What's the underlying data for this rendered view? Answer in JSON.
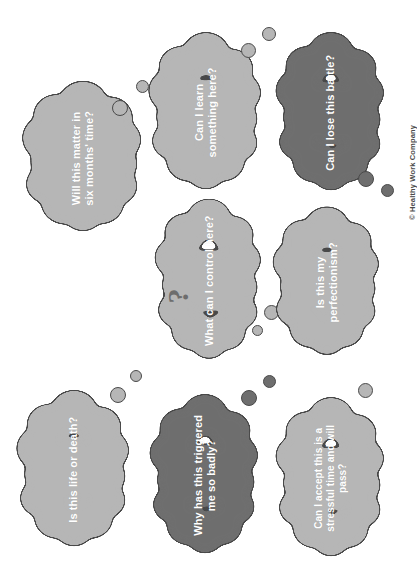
{
  "poster": {
    "background_color": "#ffffff",
    "copyright": "© Healthy Work Company",
    "palette": {
      "cloud_light": "#b6b6b6",
      "cloud_dark": "#6e6e6e",
      "outline": "#4a4a4a",
      "text": "#ffffff",
      "question_mark": "#6d6d6d"
    },
    "decorations": {
      "question_mark_glyph": "?"
    }
  },
  "clouds": [
    {
      "id": "will-this-matter",
      "text": "Will this matter in\nsix months' time?",
      "tone": "light",
      "fill": "#b6b6b6",
      "x": 28,
      "y": 93,
      "w": 110,
      "h": 130,
      "font_size": 11,
      "bubbles": [
        {
          "x": 112,
          "y": 100,
          "d": 16
        },
        {
          "x": 136,
          "y": 80,
          "d": 13
        }
      ]
    },
    {
      "id": "can-i-learn",
      "text": "Can I learn\nsomething here?",
      "tone": "light",
      "fill": "#b6b6b6",
      "x": 154,
      "y": 42,
      "w": 104,
      "h": 141,
      "font_size": 11,
      "bubbles": [
        {
          "x": 241,
          "y": 43,
          "d": 15
        },
        {
          "x": 262,
          "y": 27,
          "d": 14
        }
      ]
    },
    {
      "id": "can-i-lose-this-battle",
      "text": "Can I lose this battle?",
      "tone": "dark",
      "fill": "#6e6e6e",
      "x": 281,
      "y": 41,
      "w": 100,
      "h": 144,
      "font_size": 11,
      "bubbles": [
        {
          "x": 358,
          "y": 171,
          "d": 16
        },
        {
          "x": 381,
          "y": 184,
          "d": 13
        }
      ]
    },
    {
      "id": "what-can-i-control",
      "text": "What can I control here?",
      "tone": "light",
      "fill": "#b6b6b6",
      "x": 160,
      "y": 207,
      "w": 98,
      "h": 147,
      "font_size": 11,
      "has_question_mark": true,
      "bubbles": [
        {
          "x": 264,
          "y": 305,
          "d": 15
        },
        {
          "x": 252,
          "y": 325,
          "d": 11
        }
      ]
    },
    {
      "id": "is-this-my-perfectionism",
      "text": "Is this my\nperfectionism?",
      "tone": "light",
      "fill": "#b6b6b6",
      "x": 278,
      "y": 216,
      "w": 98,
      "h": 133,
      "font_size": 11,
      "bubbles": []
    },
    {
      "id": "is-this-life-or-death",
      "text": "Is this life or death?",
      "tone": "light",
      "fill": "#b6b6b6",
      "x": 22,
      "y": 400,
      "w": 104,
      "h": 140,
      "font_size": 11,
      "bubbles": [
        {
          "x": 110,
          "y": 387,
          "d": 16
        },
        {
          "x": 130,
          "y": 370,
          "d": 12
        }
      ]
    },
    {
      "id": "why-has-this-triggered-me",
      "text": "Why has this triggered\nme so badly?",
      "tone": "dark",
      "fill": "#6e6e6e",
      "x": 155,
      "y": 403,
      "w": 100,
      "h": 145,
      "font_size": 11,
      "bubbles": [
        {
          "x": 241,
          "y": 390,
          "d": 16
        },
        {
          "x": 263,
          "y": 375,
          "d": 13
        }
      ]
    },
    {
      "id": "can-i-accept-this",
      "text": "Can I accept this is a\nstressful time and will\npass?",
      "tone": "light",
      "fill": "#b6b6b6",
      "x": 281,
      "y": 406,
      "w": 100,
      "h": 145,
      "font_size": 10,
      "bubbles": [
        {
          "x": 358,
          "y": 383,
          "d": 15
        }
      ]
    }
  ]
}
